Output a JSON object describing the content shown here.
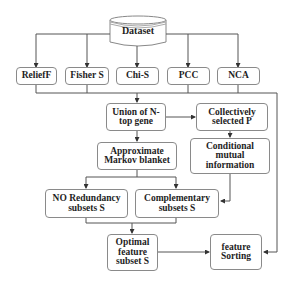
{
  "diagram": {
    "source": {
      "label": "Dataset",
      "shape": "cylinder"
    },
    "methods": [
      {
        "label": "ReliefF"
      },
      {
        "label": "Fisher S"
      },
      {
        "label": "Chi-S"
      },
      {
        "label": "PCC"
      },
      {
        "label": "NCA"
      }
    ],
    "union": {
      "label": "Union of N-top gene"
    },
    "collective": {
      "label": "Collectively selected P"
    },
    "markov": {
      "label": "Approximate Markov blanket"
    },
    "cmi": {
      "label": "Conditional mutual information"
    },
    "noredundancy": {
      "label": "NO Redundancy subsets S"
    },
    "complementary": {
      "label": "Complementary subsets S"
    },
    "optimal": {
      "label": "Optimal feature subset S"
    },
    "sorting": {
      "label": "feature Sorting"
    },
    "edges": [
      [
        "Dataset",
        "ReliefF"
      ],
      [
        "Dataset",
        "Fisher S"
      ],
      [
        "Dataset",
        "Chi-S"
      ],
      [
        "Dataset",
        "PCC"
      ],
      [
        "Dataset",
        "NCA"
      ],
      [
        "methods",
        "Union of N-top gene"
      ],
      [
        "methods",
        "feature Sorting"
      ],
      [
        "Union of N-top gene",
        "Collectively selected P"
      ],
      [
        "Union of N-top gene",
        "Approximate Markov blanket"
      ],
      [
        "Collectively selected P",
        "Conditional mutual information"
      ],
      [
        "Approximate Markov blanket",
        "NO Redundancy subsets S"
      ],
      [
        "Approximate Markov blanket",
        "Complementary subsets S"
      ],
      [
        "Conditional mutual information",
        "Complementary subsets S"
      ],
      [
        "NO Redundancy subsets S",
        "Optimal feature subset S"
      ],
      [
        "Complementary subsets S",
        "Optimal feature subset S"
      ],
      [
        "Optimal feature subset S",
        "feature Sorting"
      ]
    ]
  }
}
